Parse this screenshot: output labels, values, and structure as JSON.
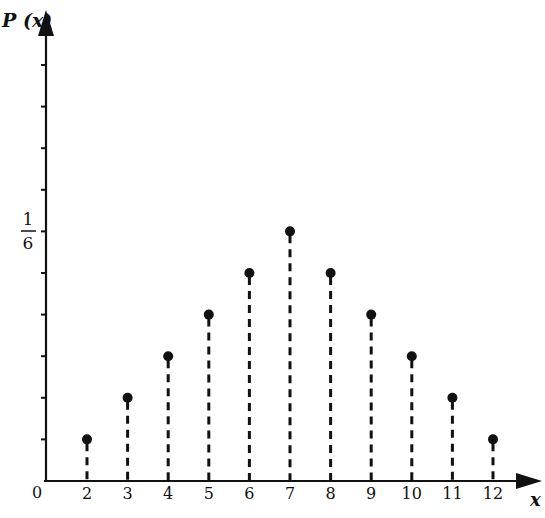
{
  "chart_data": {
    "type": "scatter",
    "style": "stem (dashed vertical lines with dot markers)",
    "title": "",
    "xlabel": "x",
    "ylabel": "P(x)",
    "x": [
      2,
      3,
      4,
      5,
      6,
      7,
      8,
      9,
      10,
      11,
      12
    ],
    "values": [
      0.0278,
      0.0556,
      0.0833,
      0.1111,
      0.1389,
      0.1667,
      0.1389,
      0.1111,
      0.0833,
      0.0556,
      0.0278
    ],
    "values_fraction": [
      "1/36",
      "2/36",
      "3/36",
      "4/36",
      "5/36",
      "6/36",
      "5/36",
      "4/36",
      "3/36",
      "2/36",
      "1/36"
    ],
    "x_tick_labels": [
      "0",
      "2",
      "3",
      "4",
      "5",
      "6",
      "7",
      "8",
      "9",
      "10",
      "11",
      "12"
    ],
    "y_tick_labels": [
      {
        "value": 0.1667,
        "label": "1/6"
      }
    ],
    "y_tick_step": 0.0278,
    "y_tick_count": 10,
    "xlim": [
      0,
      13
    ],
    "ylim": [
      0,
      0.28
    ],
    "grid": false,
    "legend": null
  },
  "labels": {
    "y_axis": "P (x)",
    "x_axis": "x",
    "origin": "0",
    "one_sixth_num": "1",
    "one_sixth_den": "6"
  },
  "style": {
    "ink": "#111111",
    "background": "#ffffff"
  }
}
